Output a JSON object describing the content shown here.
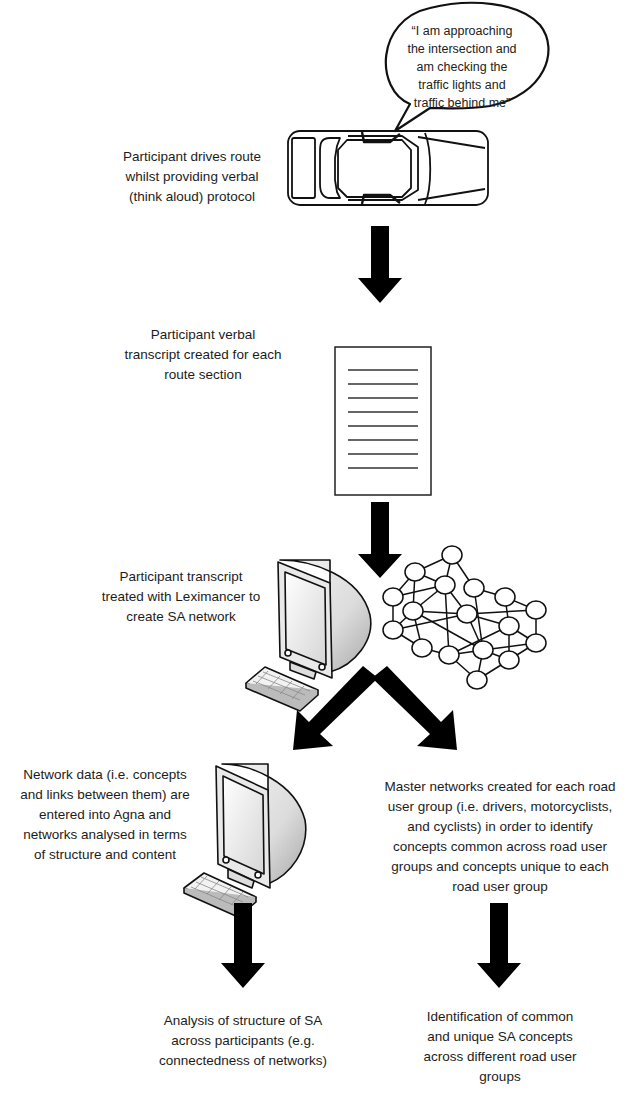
{
  "diagram": {
    "type": "flowchart",
    "steps": [
      {
        "id": "drive",
        "label": "Participant drives route\nwhilst providing verbal\n(think aloud) protocol",
        "icon": "car-icon",
        "speech_bubble": "“I am approaching\nthe intersection and\nam checking the\ntraffic lights and\ntraffic behind me”"
      },
      {
        "id": "transcript",
        "label": "Participant verbal\ntranscript created for each\nroute section",
        "icon": "document-icon"
      },
      {
        "id": "leximancer",
        "label": "Participant transcript\ntreated with Leximancer to\ncreate SA network",
        "icon": "computer-icon",
        "secondary_icon": "network-graph-icon"
      },
      {
        "id": "agna",
        "label": "Network data (i.e. concepts\nand links between them) are\nentered into Agna and\nnetworks analysed in terms\nof structure and content",
        "icon": "computer-icon"
      },
      {
        "id": "master",
        "label": "Master networks created for each road\nuser group (i.e. drivers, motorcyclists,\nand cyclists) in order to identify\nconcepts common across road user\ngroups and concepts unique to each\nroad user group"
      },
      {
        "id": "structure",
        "label": "Analysis of structure of SA\nacross participants (e.g.\nconnectedness of networks)"
      },
      {
        "id": "concepts",
        "label": "Identification of common\nand unique SA concepts\nacross different road user\ngroups"
      }
    ],
    "edges": [
      {
        "from": "drive",
        "to": "transcript"
      },
      {
        "from": "transcript",
        "to": "leximancer"
      },
      {
        "from": "leximancer",
        "to": "agna"
      },
      {
        "from": "leximancer",
        "to": "master"
      },
      {
        "from": "agna",
        "to": "structure"
      },
      {
        "from": "master",
        "to": "concepts"
      }
    ]
  },
  "colors": {
    "arrow": "#000000",
    "line": "#111111",
    "text": "#1c1c1c",
    "background": "#ffffff"
  }
}
